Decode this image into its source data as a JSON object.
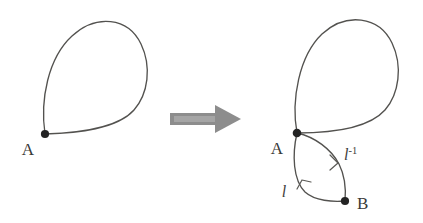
{
  "figure": {
    "background_color": "#ffffff",
    "stroke_color": "#53524f",
    "vertex_color": "#232323",
    "arrow_color": "#8d8d8d",
    "label_color": "#3a3a38",
    "panels": [
      {
        "id": "before",
        "name": "left-panel",
        "description": "A single teardrop-shaped loop based at the point A",
        "vertices": [
          {
            "id": "A",
            "label": "A",
            "x": 45,
            "y": 134,
            "label_x": 28,
            "label_y": 155
          }
        ],
        "edges": [
          {
            "id": "loop",
            "label": "",
            "from": "A",
            "to": "A"
          }
        ]
      },
      {
        "id": "after",
        "name": "right-panel",
        "description": "The same loop at A with an additional bigon between A and B, whose two arcs are labelled l and l inverse",
        "vertices": [
          {
            "id": "A",
            "label": "A",
            "x": 297,
            "y": 133,
            "label_x": 277,
            "label_y": 154
          },
          {
            "id": "B",
            "label": "B",
            "x": 345,
            "y": 201,
            "label_x": 355,
            "label_y": 208
          }
        ],
        "edges": [
          {
            "id": "loop",
            "label": "",
            "from": "A",
            "to": "A"
          },
          {
            "id": "left-arc",
            "label": "l",
            "label_base": "l",
            "label_exponent": "",
            "from": "A",
            "to": "B",
            "label_x": 289,
            "label_y": 196,
            "direction": "up"
          },
          {
            "id": "right-arc",
            "label": "l-1",
            "label_base": "l",
            "label_exponent": "-1",
            "from": "B",
            "to": "A",
            "label_x": 346,
            "label_y": 158,
            "direction": "down"
          }
        ]
      }
    ],
    "transform_arrow": {
      "name": "transformation-arrow",
      "label": "",
      "from_x": 170,
      "to_x": 241,
      "y": 119
    }
  }
}
